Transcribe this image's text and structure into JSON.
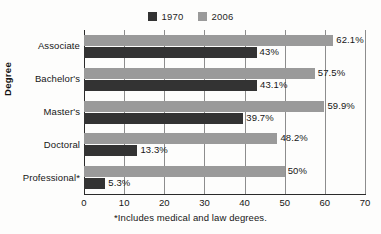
{
  "legend": {
    "position": "top-center",
    "entries": [
      {
        "label": "1970",
        "color": "#333333",
        "icon": "legend-swatch-icon"
      },
      {
        "label": "2006",
        "color": "#9a9a9a",
        "icon": "legend-swatch-icon"
      }
    ]
  },
  "axes": {
    "y_title": "Degree",
    "x_ticks": [
      "0",
      "10",
      "20",
      "30",
      "40",
      "50",
      "60",
      "70"
    ]
  },
  "footnote": "*Includes medical and law degrees.",
  "chart_data": {
    "type": "bar",
    "orientation": "horizontal",
    "title": "",
    "subtitle": "",
    "xlabel": "",
    "ylabel": "Degree",
    "categories": [
      "Associate",
      "Bachelor's",
      "Master's",
      "Doctoral",
      "Professional*"
    ],
    "series": [
      {
        "name": "1970",
        "color": "#333333",
        "values": [
          43,
          43.1,
          39.7,
          13.3,
          5.3
        ],
        "labels": [
          "43%",
          "43.1%",
          "39.7%",
          "13.3%",
          "5.3%"
        ]
      },
      {
        "name": "2006",
        "color": "#9a9a9a",
        "values": [
          62.1,
          57.5,
          59.9,
          48.2,
          50
        ],
        "labels": [
          "62.1%",
          "57.5%",
          "59.9%",
          "48.2%",
          "50%"
        ]
      }
    ],
    "xlim": [
      0,
      70
    ],
    "xticks": [
      0,
      10,
      20,
      30,
      40,
      50,
      60,
      70
    ],
    "grid": "vertical",
    "legend_position": "top-center",
    "annotations": [
      "*Includes medical and law degrees."
    ]
  }
}
